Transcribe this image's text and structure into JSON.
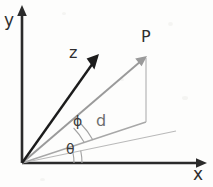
{
  "figure": {
    "background_color": "#fdfdfc",
    "axes": {
      "y_label": "y",
      "x_label": "x",
      "axis_color": "#2b2b2b",
      "origin": {
        "x": 22,
        "y": 163
      },
      "y_tip": {
        "x": 22,
        "y": 8
      },
      "x_tip": {
        "x": 206,
        "y": 163
      }
    },
    "vectors": [
      {
        "name": "z-axis-vector",
        "label": "z",
        "color": "#1c1c1c",
        "from": {
          "x": 22,
          "y": 163
        },
        "to": {
          "x": 98,
          "y": 56
        },
        "label_pos": {
          "x": 69,
          "y": 47
        }
      },
      {
        "name": "position-vector-P",
        "label": "P",
        "color": "#9a9a9a",
        "from": {
          "x": 22,
          "y": 163
        },
        "to": {
          "x": 146,
          "y": 57
        },
        "label_pos": {
          "x": 142,
          "y": 31
        }
      }
    ],
    "segments": [
      {
        "name": "d-projection-line",
        "label": "d",
        "color": "#a8a8a8",
        "from": {
          "x": 22,
          "y": 163
        },
        "to": {
          "x": 146,
          "y": 122
        },
        "label_pos": {
          "x": 96,
          "y": 114
        }
      },
      {
        "name": "vertical-drop-line",
        "label": "",
        "color": "#b6b6b6",
        "from": {
          "x": 146,
          "y": 57
        },
        "to": {
          "x": 146,
          "y": 122
        }
      },
      {
        "name": "theta-reference-line",
        "label": "",
        "color": "#b9b9b9",
        "from": {
          "x": 22,
          "y": 163
        },
        "to": {
          "x": 176,
          "y": 131
        }
      }
    ],
    "angles": [
      {
        "name": "angle-phi",
        "label": "ϕ",
        "description": "elevation angle between d line and vector P",
        "vertex": {
          "x": 22,
          "y": 163
        },
        "radius": 66,
        "label_pos": {
          "x": 73,
          "y": 116
        }
      },
      {
        "name": "angle-theta",
        "label": "θ",
        "description": "azimuth angle between x axis and projection line",
        "vertex": {
          "x": 22,
          "y": 163
        },
        "radius": 52,
        "label_pos": {
          "x": 66,
          "y": 143
        }
      }
    ]
  }
}
